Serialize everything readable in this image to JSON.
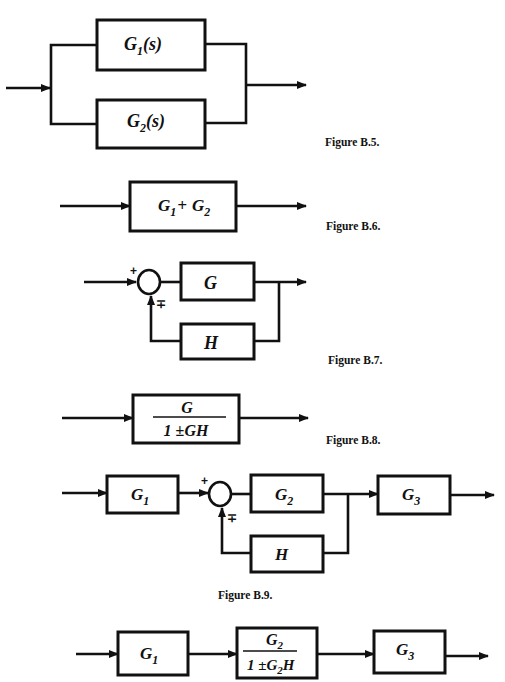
{
  "figures": [
    {
      "id": "B.5",
      "caption": "Figure B.5.",
      "description": "Two blocks in parallel",
      "blocks": [
        {
          "name": "G1",
          "base": "G",
          "sub": "1",
          "suffix": "(s)"
        },
        {
          "name": "G2",
          "base": "G",
          "sub": "2",
          "suffix": "(s)"
        }
      ]
    },
    {
      "id": "B.6",
      "caption": "Figure B.6.",
      "description": "Equivalent single block",
      "blocks": [
        {
          "name": "G1+G2",
          "a_base": "G",
          "a_sub": "1",
          "op": "+",
          "b_base": "G",
          "b_sub": "2"
        }
      ]
    },
    {
      "id": "B.7",
      "caption": "Figure B.7.",
      "description": "Feedback loop",
      "summing_junction": {
        "input_sign": "+",
        "feedback_sign": "∓"
      },
      "blocks": [
        {
          "name": "G",
          "label": "G"
        },
        {
          "name": "H",
          "label": "H"
        }
      ]
    },
    {
      "id": "B.8",
      "caption": "Figure B.8.",
      "description": "Equivalent closed-loop block",
      "blocks": [
        {
          "name": "G/(1±GH)",
          "numerator": "G",
          "denominator": "1 ±GH"
        }
      ]
    },
    {
      "id": "B.9",
      "caption": "Figure B.9.",
      "description": "Cascade with inner feedback loop",
      "summing_junction": {
        "input_sign": "+",
        "feedback_sign": "∓"
      },
      "blocks": [
        {
          "name": "G1",
          "base": "G",
          "sub": "1"
        },
        {
          "name": "G2",
          "base": "G",
          "sub": "2"
        },
        {
          "name": "H",
          "label": "H"
        },
        {
          "name": "G3",
          "base": "G",
          "sub": "3"
        }
      ]
    },
    {
      "id": "B.10",
      "caption": "",
      "description": "Reduced cascade",
      "blocks": [
        {
          "name": "G1",
          "base": "G",
          "sub": "1"
        },
        {
          "name": "G2/(1±G2H)",
          "num_base": "G",
          "num_sub": "2",
          "den_prefix": "1 ±",
          "den_base": "G",
          "den_sub": "2",
          "den_suffix": "H"
        },
        {
          "name": "G3",
          "base": "G",
          "sub": "3"
        }
      ]
    }
  ]
}
